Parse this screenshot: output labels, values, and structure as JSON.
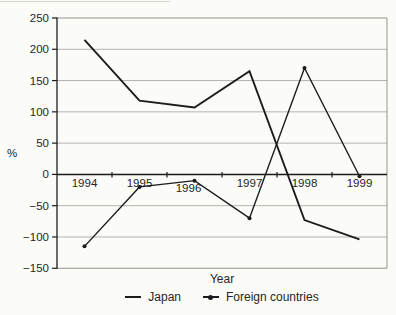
{
  "chart_data": {
    "type": "line",
    "title": "",
    "xlabel": "Year",
    "ylabel": "%",
    "categories": [
      "1994",
      "1995",
      "1996",
      "1997",
      "1998",
      "1999"
    ],
    "series": [
      {
        "name": "Japan",
        "marker": "none",
        "color": "#1c1c1c",
        "values": [
          215,
          118,
          107,
          165,
          -73,
          -104
        ]
      },
      {
        "name": "Foreign countries",
        "marker": "dot",
        "color": "#1c1c1c",
        "values": [
          -115,
          -20,
          -10,
          -70,
          170,
          -3
        ]
      }
    ],
    "ylim": [
      -150,
      250
    ],
    "yticks": [
      250,
      200,
      150,
      100,
      50,
      0,
      -50,
      -100,
      -150
    ],
    "grid": true,
    "legend_position": "bottom",
    "axis_color": "#1c1c1c",
    "grid_color": "#b3b3ae",
    "border_color": "#97978f",
    "text_color": "#262624",
    "background_color": "#fbfbf8"
  }
}
